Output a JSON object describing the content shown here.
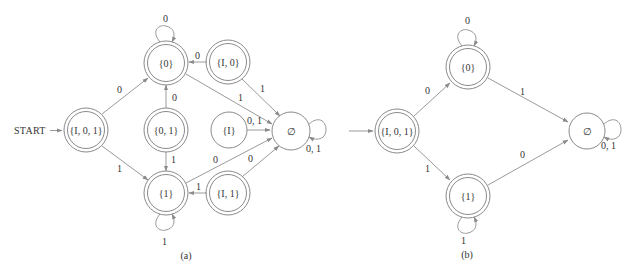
{
  "colors": {
    "stroke": "#8a8a8a",
    "edge": "#9a9a9a",
    "text": "#333333",
    "background": "#ffffff"
  },
  "diagram_a": {
    "caption": "(a)",
    "start_label": "START",
    "states": {
      "I01": {
        "label": "{I, 0, 1}",
        "accepting": true
      },
      "s0": {
        "label": "{0}",
        "accepting": true
      },
      "s01": {
        "label": "{0, 1}",
        "accepting": true
      },
      "s1": {
        "label": "{1}",
        "accepting": true
      },
      "I0": {
        "label": "{I, 0}",
        "accepting": true
      },
      "I1": {
        "label": "{I, 1}",
        "accepting": true
      },
      "I": {
        "label": "{I}",
        "accepting": false
      },
      "empty": {
        "label": "∅",
        "accepting": false
      }
    },
    "edges": {
      "I01_to_s0": "0",
      "I01_to_s1": "1",
      "s0_loop": "0",
      "s1_loop": "1",
      "I0_to_s0": "0",
      "I0_to_empty": "1",
      "s0_to_empty": "1",
      "s01_to_s0": "0",
      "s01_to_s1": "1",
      "I_to_empty": "0, 1",
      "s1_to_empty": "0",
      "I1_to_s1": "1",
      "I1_to_empty": "0",
      "empty_loop": "0, 1"
    }
  },
  "diagram_b": {
    "caption": "(b)",
    "states": {
      "I01": {
        "label": "{I, 0, 1}",
        "accepting": true
      },
      "s0": {
        "label": "{0}",
        "accepting": true
      },
      "s1": {
        "label": "{1}",
        "accepting": true
      },
      "empty": {
        "label": "∅",
        "accepting": false
      }
    },
    "edges": {
      "I01_to_s0": "0",
      "I01_to_s1": "1",
      "s0_loop": "0",
      "s1_loop": "1",
      "s0_to_empty": "1",
      "s1_to_empty": "0",
      "empty_loop": "0, 1"
    }
  }
}
